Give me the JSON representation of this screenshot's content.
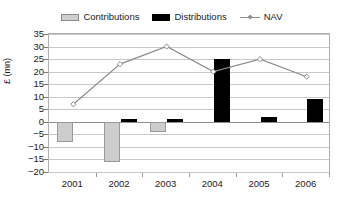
{
  "legend": {
    "items": [
      {
        "label": "Contributions",
        "icon": "gray-square-swatch",
        "color": "#cdcdcd"
      },
      {
        "label": "Distributions",
        "icon": "black-square-swatch",
        "color": "#000000"
      },
      {
        "label": "NAV",
        "icon": "line-diamond-marker",
        "color": "#8c8c8c"
      }
    ]
  },
  "axes": {
    "ylabel": "£ (mn)",
    "yticks": [
      "35",
      "30",
      "25",
      "20",
      "15",
      "10",
      "5",
      "0",
      "-5",
      "-10",
      "-15",
      "-20"
    ],
    "xticks": [
      "2001",
      "2002",
      "2003",
      "2004",
      "2005",
      "2006"
    ]
  },
  "chart_data": {
    "type": "bar",
    "title": "",
    "xlabel": "",
    "ylabel": "£ (mn)",
    "ylim": [
      -20,
      35
    ],
    "ytick_step": 5,
    "grid": true,
    "legend_position": "top-center",
    "categories": [
      "2001",
      "2002",
      "2003",
      "2004",
      "2005",
      "2006"
    ],
    "series": [
      {
        "name": "Contributions",
        "type": "bar",
        "color": "#cdcdcd",
        "values": [
          -8,
          -16,
          -4,
          0,
          0,
          0
        ]
      },
      {
        "name": "Distributions",
        "type": "bar",
        "color": "#000000",
        "values": [
          0,
          1,
          1,
          25,
          2,
          9
        ]
      },
      {
        "name": "NAV",
        "type": "line",
        "color": "#8c8c8c",
        "values": [
          7,
          23,
          30,
          20,
          25,
          18
        ]
      }
    ]
  }
}
